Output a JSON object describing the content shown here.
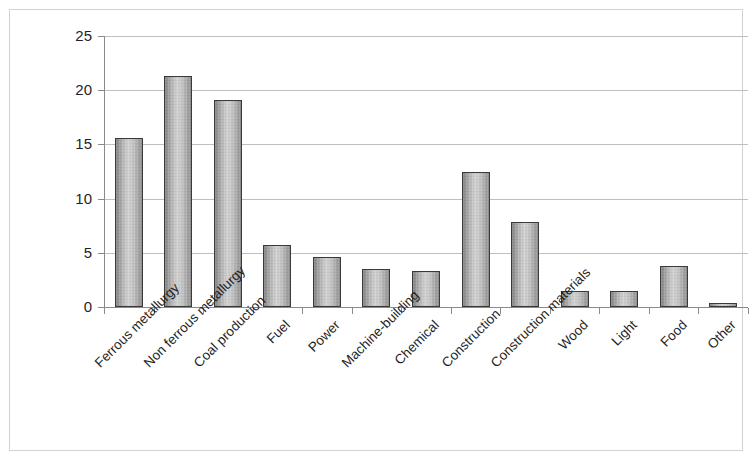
{
  "chart_data": {
    "type": "bar",
    "title": "",
    "subtitle": "",
    "xlabel": "",
    "ylabel": "",
    "ylim": [
      0,
      25
    ],
    "xlim_note": "13 categories, evenly spaced",
    "yticks": [
      0,
      5,
      10,
      15,
      20,
      25
    ],
    "ytick_labels": [
      "0",
      "5",
      "10",
      "15",
      "20",
      "25"
    ],
    "grid": "horizontal",
    "legend": "none",
    "bar_style": "gray-gradient-fill-with-dark-outline",
    "categories": [
      "Ferrous metallurgy",
      "Non ferrous metallurgy",
      "Coal production",
      "Fuel",
      "Power",
      "Machine-building",
      "Chemical",
      "Construction",
      "Construction materials",
      "Wood",
      "Light",
      "Food",
      "Other"
    ],
    "values": [
      15.6,
      21.3,
      19.1,
      5.7,
      4.6,
      3.5,
      3.3,
      12.5,
      7.8,
      1.5,
      1.5,
      3.8,
      0.4
    ],
    "series": [
      {
        "name": "Share",
        "values": [
          15.6,
          21.3,
          19.1,
          5.7,
          4.6,
          3.5,
          3.3,
          12.5,
          7.8,
          1.5,
          1.5,
          3.8,
          0.4
        ]
      }
    ]
  },
  "colors": {
    "frame": "#d2d2d2",
    "axis": "#8a8a8a",
    "gridline": "#bfbfbf",
    "bar_outline": "#3a3a3a",
    "bar_fill_light": "#d2d2d2",
    "bar_fill_dark": "#808080",
    "text": "#1f1f1f",
    "background": "#ffffff"
  }
}
